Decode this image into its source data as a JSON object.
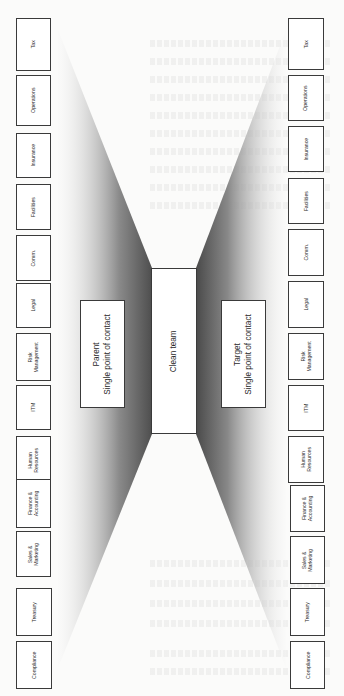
{
  "diagram": {
    "orientation": "rotated-90-ccw",
    "center": {
      "clean_team": "Clean team",
      "parent": {
        "title": "Parent",
        "subtitle": "Single point of contact"
      },
      "target": {
        "title": "Target",
        "subtitle": "Single point of contact"
      }
    },
    "parent_functions": [
      {
        "line1": "Tax",
        "line2": ""
      },
      {
        "line1": "Operations",
        "line2": ""
      },
      {
        "line1": "Insurance",
        "line2": ""
      },
      {
        "line1": "Facilities",
        "line2": ""
      },
      {
        "line1": "Comm.",
        "line2": ""
      },
      {
        "line1": "Legal",
        "line2": ""
      },
      {
        "line1": "Risk",
        "line2": "Management"
      },
      {
        "line1": "ITM",
        "line2": ""
      },
      {
        "line1": "Human",
        "line2": "Resources"
      },
      {
        "line1": "Finance &",
        "line2": "Accounting"
      },
      {
        "line1": "Sales &",
        "line2": "Marketing"
      },
      {
        "line1": "Treasury",
        "line2": ""
      },
      {
        "line1": "Compliance",
        "line2": ""
      }
    ],
    "target_functions": [
      {
        "line1": "Tax",
        "line2": ""
      },
      {
        "line1": "Operations",
        "line2": ""
      },
      {
        "line1": "Insurance",
        "line2": ""
      },
      {
        "line1": "Facilities",
        "line2": ""
      },
      {
        "line1": "Comm.",
        "line2": ""
      },
      {
        "line1": "Legal",
        "line2": ""
      },
      {
        "line1": "Risk",
        "line2": "Management"
      },
      {
        "line1": "ITM",
        "line2": ""
      },
      {
        "line1": "Human",
        "line2": "Resources"
      },
      {
        "line1": "Finance &",
        "line2": "Accounting"
      },
      {
        "line1": "Sales &",
        "line2": "Marketing"
      },
      {
        "line1": "Treasury",
        "line2": ""
      },
      {
        "line1": "Compliance",
        "line2": ""
      }
    ],
    "colors": {
      "box_border": "#3a3a3a",
      "fan_dark": "#5a5a5a",
      "fan_light": "#f4f4f4",
      "page": "#fbfbfa"
    }
  }
}
